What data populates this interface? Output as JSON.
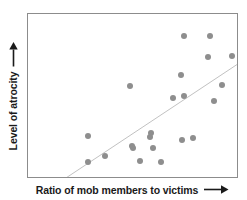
{
  "chart_data": {
    "type": "scatter",
    "title": "",
    "xlabel": "Ratio of mob members to victims",
    "ylabel": "Level of atrocity",
    "xlabel_arrow": "right-arrow",
    "ylabel_arrow": "up-arrow",
    "grid": false,
    "legend": null,
    "axis_ticks": false,
    "xlim": [
      0,
      1
    ],
    "ylim": [
      0,
      1
    ],
    "marker_color": "#8e8e8e",
    "frame_color": "#8c8c8c",
    "trendline": {
      "label": "least-squares fit",
      "color": "#9a9a9a",
      "x0": 0.165,
      "y0": -0.02,
      "x1": 1.0,
      "y1": 0.69
    },
    "points": [
      {
        "x": 0.745,
        "y": 0.865
      },
      {
        "x": 0.87,
        "y": 0.862
      },
      {
        "x": 0.862,
        "y": 0.737
      },
      {
        "x": 0.975,
        "y": 0.74
      },
      {
        "x": 0.73,
        "y": 0.628
      },
      {
        "x": 0.93,
        "y": 0.565
      },
      {
        "x": 0.488,
        "y": 0.56
      },
      {
        "x": 0.695,
        "y": 0.487
      },
      {
        "x": 0.745,
        "y": 0.498
      },
      {
        "x": 0.888,
        "y": 0.468
      },
      {
        "x": 0.285,
        "y": 0.25
      },
      {
        "x": 0.588,
        "y": 0.272
      },
      {
        "x": 0.585,
        "y": 0.245
      },
      {
        "x": 0.79,
        "y": 0.238
      },
      {
        "x": 0.735,
        "y": 0.228
      },
      {
        "x": 0.498,
        "y": 0.188
      },
      {
        "x": 0.503,
        "y": 0.178
      },
      {
        "x": 0.597,
        "y": 0.178
      },
      {
        "x": 0.37,
        "y": 0.128
      },
      {
        "x": 0.285,
        "y": 0.092
      },
      {
        "x": 0.538,
        "y": 0.1
      },
      {
        "x": 0.638,
        "y": 0.092
      }
    ]
  }
}
